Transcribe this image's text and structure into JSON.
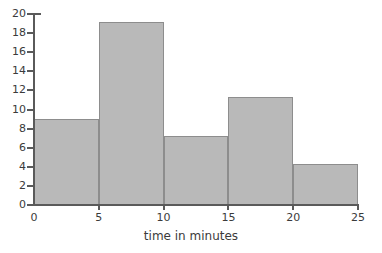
{
  "chart_data": {
    "type": "bar",
    "title": "",
    "subtitle": "",
    "xlabel": "time in minutes",
    "ylabel": "",
    "bin_edges": [
      0,
      5,
      10,
      15,
      20,
      25
    ],
    "categories": [
      "0-5",
      "5-10",
      "10-15",
      "15-20",
      "20-25"
    ],
    "values": [
      9,
      19.2,
      7.2,
      11.3,
      4.3
    ],
    "xlim": [
      0,
      25
    ],
    "ylim": [
      0,
      20
    ],
    "x_ticks": [
      "0",
      "5",
      "10",
      "15",
      "20",
      "25"
    ],
    "y_ticks": [
      "0",
      "2",
      "4",
      "6",
      "8",
      "10",
      "12",
      "14",
      "16",
      "18",
      "20"
    ],
    "x_tick_values": [
      0,
      5,
      10,
      15,
      20,
      25
    ],
    "y_tick_values": [
      0,
      2,
      4,
      6,
      8,
      10,
      12,
      14,
      16,
      18,
      20
    ],
    "grid": false,
    "legend": false,
    "legend_position": "none",
    "bar_fill_color": "#b9b9b9",
    "bar_border_color": "#8d8d8d",
    "axis_color": "#5a5a5a",
    "text_color": "#3b3b3b",
    "background_color": "#ffffff"
  }
}
